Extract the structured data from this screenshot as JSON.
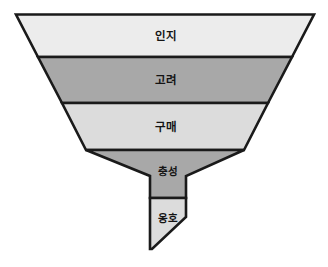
{
  "diagram": {
    "type": "funnel",
    "title": "",
    "orientation": "inverted-triangle-with-spout",
    "background_color": "#ffffff",
    "outline_color": "#1a1a1a",
    "stages": [
      {
        "id": "awareness",
        "label": "인지",
        "fill": "#ececec",
        "order": 1,
        "shape": "trapezoid",
        "points": "16,14.5 314,14.5 292,57 38,57",
        "label_x": 166,
        "label_y": 36
      },
      {
        "id": "consideration",
        "label": "고려",
        "fill": "#a8a8a8",
        "order": 2,
        "shape": "trapezoid",
        "points": "38,57 292,57 268,103 62,103",
        "label_x": 166,
        "label_y": 80
      },
      {
        "id": "purchase",
        "label": "구매",
        "fill": "#dcdcdc",
        "order": 3,
        "shape": "trapezoid",
        "points": "62,103 268,103 244,150 86,150",
        "label_x": 166,
        "label_y": 127
      },
      {
        "id": "loyalty",
        "label": "충성",
        "fill": "#a8a8a8",
        "order": 4,
        "shape": "trapezoid-to-neck",
        "points": "86,150 244,150 186,176 186,198 150,198 150,176",
        "label_x": 168,
        "label_y": 172
      },
      {
        "id": "advocacy",
        "label": "옹호",
        "fill": "#dcdcdc",
        "order": 5,
        "shape": "spout-angled",
        "points": "150,198 186,198 186,217 152,249 150,249",
        "label_x": 168,
        "label_y": 219
      }
    ]
  }
}
